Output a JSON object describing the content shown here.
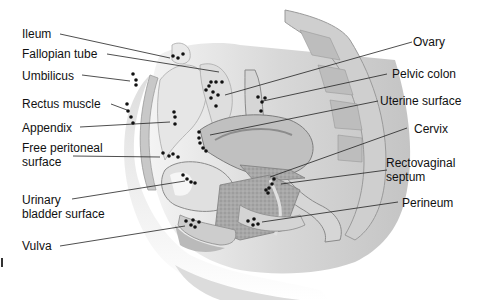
{
  "figure": {
    "type": "anatomical-sagittal-section",
    "marker_style": "black dots indicating sites"
  },
  "labels_left": [
    {
      "id": "ileum",
      "text": "Ileum"
    },
    {
      "id": "fallopian-tube",
      "text": "Fallopian tube"
    },
    {
      "id": "umbilicus",
      "text": "Umbilicus"
    },
    {
      "id": "rectus-muscle",
      "text": "Rectus muscle"
    },
    {
      "id": "appendix",
      "text": "Appendix"
    },
    {
      "id": "free-peritoneal-surface",
      "text": "Free peritoneal surface",
      "lines": [
        "Free peritoneal",
        "surface"
      ]
    },
    {
      "id": "urinary-bladder-surface",
      "text": "Urinary bladder surface",
      "lines": [
        "Urinary",
        "bladder surface"
      ]
    },
    {
      "id": "vulva",
      "text": "Vulva"
    }
  ],
  "labels_right": [
    {
      "id": "ovary",
      "text": "Ovary"
    },
    {
      "id": "pelvic-colon",
      "text": "Pelvic colon"
    },
    {
      "id": "uterine-surface",
      "text": "Uterine surface"
    },
    {
      "id": "cervix",
      "text": "Cervix"
    },
    {
      "id": "rectovaginal-septum",
      "text": "Rectovaginal septum",
      "lines": [
        "Rectovaginal",
        "septum"
      ]
    },
    {
      "id": "perineum",
      "text": "Perineum"
    }
  ],
  "colors": {
    "background": "#ffffff",
    "leader_line": "#222222",
    "marker": "#111111",
    "tissue_light": "#e4e4e4",
    "tissue_mid": "#bdbdbd",
    "tissue_dark": "#8c8c8c"
  }
}
